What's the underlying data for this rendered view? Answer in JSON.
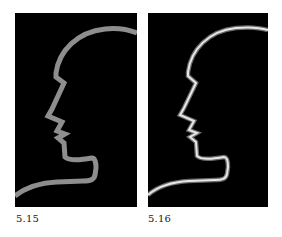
{
  "figures": [
    {
      "caption": "5.15",
      "style": "flat",
      "background": "#000000",
      "stroke_color": "#8e8e8e",
      "stroke_width": 5
    },
    {
      "caption": "5.16",
      "style": "beveled",
      "background": "#000000",
      "stroke_color": "#e6e6e6",
      "stroke_edge_color": "#6a6a6a",
      "stroke_width": 4
    }
  ]
}
